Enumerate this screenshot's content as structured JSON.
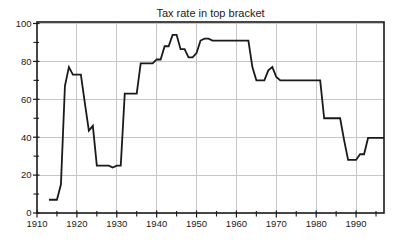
{
  "figure": {
    "background_color": "#ffffff",
    "line_color": "#1a1a1a",
    "grid_color": "#c6c6c6",
    "axis_color": "#1a1a1a",
    "text_color": "#1a1a1a"
  },
  "chart_data": {
    "type": "line",
    "title": "Tax rate in top bracket",
    "xlabel": "",
    "ylabel": "",
    "xlim": [
      1910,
      1997
    ],
    "ylim": [
      0,
      100
    ],
    "grid": true,
    "legend_position": "none",
    "x_major_ticks": [
      1910,
      1920,
      1930,
      1940,
      1950,
      1960,
      1970,
      1980,
      1990
    ],
    "x_minor_ticks": [
      1915,
      1925,
      1935,
      1945,
      1955,
      1965,
      1975,
      1985,
      1995
    ],
    "y_major_ticks": [
      0,
      20,
      40,
      60,
      80,
      100
    ],
    "y_minor_ticks": [
      10,
      30,
      50,
      70,
      90
    ],
    "x_gridlines": [
      1920,
      1930,
      1940,
      1950,
      1960,
      1970,
      1980,
      1990
    ],
    "y_gridlines": [
      20,
      40,
      60,
      80,
      100
    ],
    "series": [
      {
        "points": [
          [
            1913,
            7
          ],
          [
            1914,
            7
          ],
          [
            1915,
            7
          ],
          [
            1916,
            15
          ],
          [
            1917,
            67
          ],
          [
            1918,
            77
          ],
          [
            1919,
            73
          ],
          [
            1920,
            73
          ],
          [
            1921,
            73
          ],
          [
            1922,
            58
          ],
          [
            1923,
            43.5
          ],
          [
            1924,
            46
          ],
          [
            1925,
            25
          ],
          [
            1926,
            25
          ],
          [
            1927,
            25
          ],
          [
            1928,
            25
          ],
          [
            1929,
            24
          ],
          [
            1930,
            25
          ],
          [
            1931,
            25
          ],
          [
            1932,
            63
          ],
          [
            1933,
            63
          ],
          [
            1934,
            63
          ],
          [
            1935,
            63
          ],
          [
            1936,
            79
          ],
          [
            1937,
            79
          ],
          [
            1938,
            79
          ],
          [
            1939,
            79
          ],
          [
            1940,
            81.1
          ],
          [
            1941,
            81
          ],
          [
            1942,
            88
          ],
          [
            1943,
            88
          ],
          [
            1944,
            94
          ],
          [
            1945,
            94
          ],
          [
            1946,
            86.45
          ],
          [
            1947,
            86.45
          ],
          [
            1948,
            82.13
          ],
          [
            1949,
            82.13
          ],
          [
            1950,
            84.36
          ],
          [
            1951,
            91
          ],
          [
            1952,
            92
          ],
          [
            1953,
            92
          ],
          [
            1954,
            91
          ],
          [
            1955,
            91
          ],
          [
            1956,
            91
          ],
          [
            1957,
            91
          ],
          [
            1958,
            91
          ],
          [
            1959,
            91
          ],
          [
            1960,
            91
          ],
          [
            1961,
            91
          ],
          [
            1962,
            91
          ],
          [
            1963,
            91
          ],
          [
            1964,
            77
          ],
          [
            1965,
            70
          ],
          [
            1966,
            70
          ],
          [
            1967,
            70
          ],
          [
            1968,
            75.25
          ],
          [
            1969,
            77
          ],
          [
            1970,
            71.75
          ],
          [
            1971,
            70
          ],
          [
            1972,
            70
          ],
          [
            1973,
            70
          ],
          [
            1974,
            70
          ],
          [
            1975,
            70
          ],
          [
            1976,
            70
          ],
          [
            1977,
            70
          ],
          [
            1978,
            70
          ],
          [
            1979,
            70
          ],
          [
            1980,
            70
          ],
          [
            1981,
            70
          ],
          [
            1982,
            50
          ],
          [
            1983,
            50
          ],
          [
            1984,
            50
          ],
          [
            1985,
            50
          ],
          [
            1986,
            50
          ],
          [
            1987,
            38.5
          ],
          [
            1988,
            28
          ],
          [
            1989,
            28
          ],
          [
            1990,
            28
          ],
          [
            1991,
            31
          ],
          [
            1992,
            31
          ],
          [
            1993,
            39.6
          ],
          [
            1994,
            39.6
          ],
          [
            1995,
            39.6
          ],
          [
            1996,
            39.6
          ],
          [
            1997,
            39.6
          ]
        ]
      }
    ]
  }
}
